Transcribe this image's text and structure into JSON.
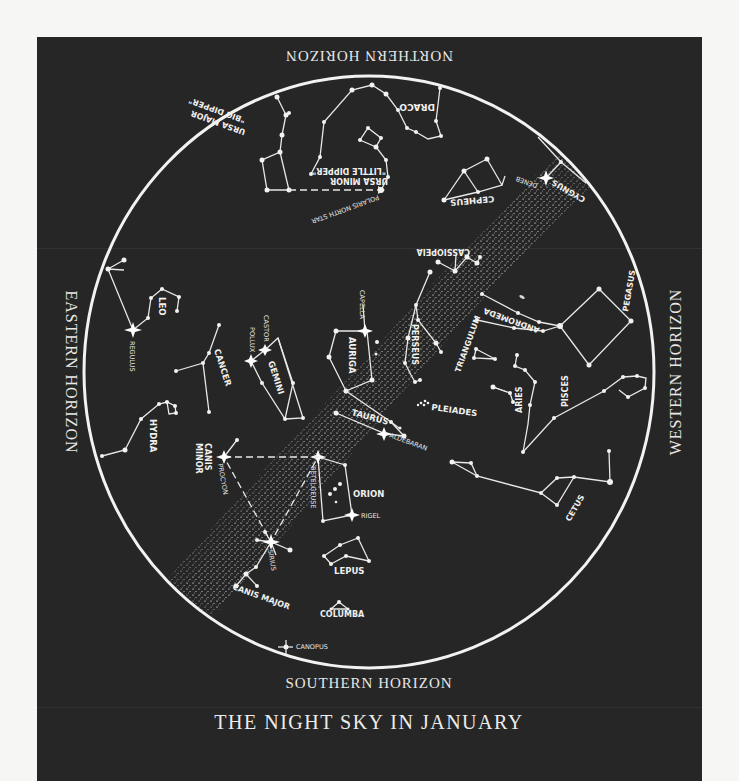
{
  "title": "THE NIGHT SKY IN JANUARY",
  "horizons": {
    "north": "NORTHERN HORIZON",
    "south": "SOUTHERN HORIZON",
    "east": "EASTERN HORIZON",
    "west": "WESTERN HORIZON"
  },
  "constellations": {
    "ursa_major": "URSA MAJOR",
    "big_dipper": "\"BIG DIPPER\"",
    "ursa_minor": "URSA MINOR",
    "little_dipper": "\"LITTLE DIPPER\"",
    "draco": "DRACO",
    "cepheus": "CEPHEUS",
    "cygnus": "CYGNUS",
    "cassiopeia": "CASSIOPEIA",
    "pegasus": "PEGASUS",
    "andromeda": "ANDROMEDA",
    "triangulum": "TRIANGULUM",
    "perseus": "PERSEUS",
    "auriga": "AURIGA",
    "taurus": "TAURUS",
    "pleiades": "PLEIADES",
    "aries": "ARIES",
    "pisces": "PISCES",
    "cetus": "CETUS",
    "orion": "ORION",
    "lepus": "LEPUS",
    "columba": "COLUMBA",
    "canis_major": "CANIS MAJOR",
    "canis_minor_1": "CANIS",
    "canis_minor_2": "MINOR",
    "gemini": "GEMINI",
    "cancer": "CANCER",
    "leo": "LEO",
    "hydra": "HYDRA"
  },
  "stars": {
    "polaris": "POLARIS  NORTH STAR",
    "deneb": "DENEB",
    "capella": "CAPELLA",
    "aldebaran": "ALDEBARAN",
    "betelgeuse": "BETELGEUSE",
    "rigel": "RIGEL",
    "sirius": "SIRIUS",
    "procyon": "PROCYON",
    "canopus": "CANOPUS",
    "castor": "CASTOR",
    "pollux": "POLLUX",
    "regulus": "REGULUS",
    "m31": "M31"
  },
  "colors": {
    "background": "#262626",
    "page": "#f6f6f4",
    "ink": "#f0f0ee"
  }
}
